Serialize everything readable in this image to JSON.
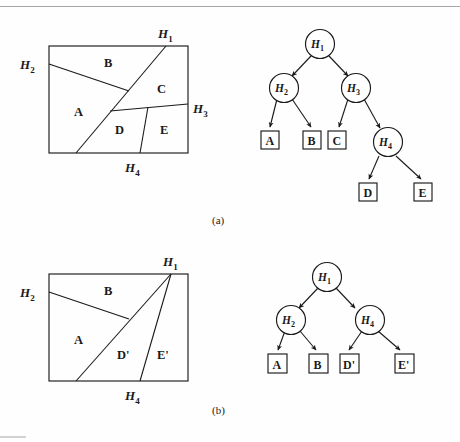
{
  "document": {
    "title": "Binary space partition example figures",
    "figures": [
      {
        "id": "a",
        "caption": "(a)",
        "partition": {
          "name": "bsp-partition-a",
          "hyperplane_labels": [
            "H_1",
            "H_2",
            "H_3",
            "H_4"
          ],
          "hyperplane_display": [
            {
              "base": "H",
              "sub": "1"
            },
            {
              "base": "H",
              "sub": "2"
            },
            {
              "base": "H",
              "sub": "3"
            },
            {
              "base": "H",
              "sub": "4"
            }
          ],
          "region_labels": [
            "A",
            "B",
            "C",
            "D",
            "E"
          ]
        },
        "tree": {
          "name": "bsp-tree-a",
          "internal_nodes": [
            {
              "base": "H",
              "sub": "1"
            },
            {
              "base": "H",
              "sub": "2"
            },
            {
              "base": "H",
              "sub": "3"
            },
            {
              "base": "H",
              "sub": "4"
            }
          ],
          "leaves": [
            "A",
            "B",
            "C",
            "D",
            "E"
          ]
        }
      },
      {
        "id": "b",
        "caption": "(b)",
        "partition": {
          "name": "bsp-partition-b",
          "hyperplane_display": [
            {
              "base": "H",
              "sub": "1"
            },
            {
              "base": "H",
              "sub": "2"
            },
            {
              "base": "H",
              "sub": "4"
            }
          ],
          "region_labels": [
            "A",
            "B",
            "D'",
            "E'"
          ]
        },
        "tree": {
          "name": "bsp-tree-b",
          "internal_nodes": [
            {
              "base": "H",
              "sub": "1"
            },
            {
              "base": "H",
              "sub": "2"
            },
            {
              "base": "H",
              "sub": "4"
            }
          ],
          "leaves": [
            "A",
            "B",
            "D'",
            "E'"
          ]
        }
      }
    ],
    "colors": {
      "ink": "#1a1a1a",
      "paper": "#fefefe",
      "scan_rule": "#8f8f8f"
    }
  }
}
